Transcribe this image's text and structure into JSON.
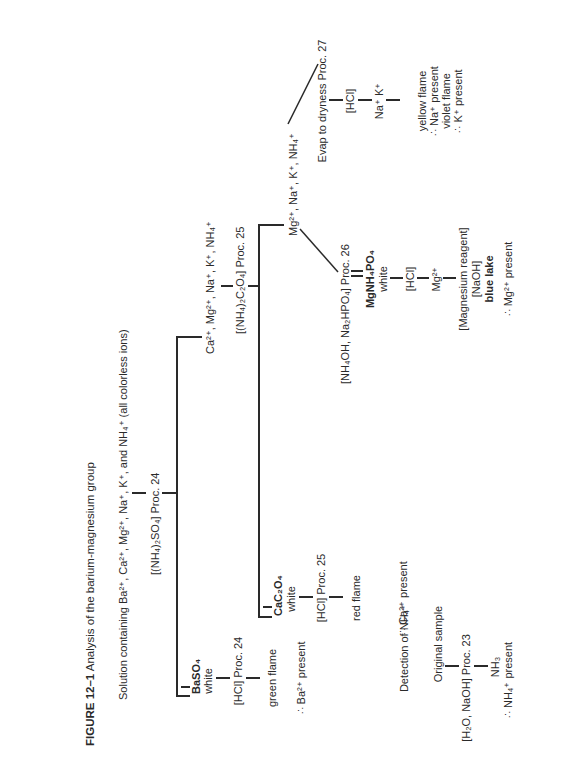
{
  "figure": {
    "title_label": "FIGURE 12–1",
    "title_text": "Analysis of the barium-magnesium group"
  },
  "solution": {
    "prefix": "Solution containing Ba",
    "ions_text": "Solution containing Ba²⁺, Ca²⁺, Mg²⁺, Na⁺, K⁺, and NH₄⁺ (all colorless ions)"
  },
  "steps": {
    "reagent_1": "[(NH₄)₂SO₄] Proc. 24",
    "baso4": "BaSO₄",
    "baso4_color": "white",
    "ba_reagent": "[HCl] Proc. 24",
    "ba_flame": "green flame",
    "ba_result": "∴ Ba²⁺ present",
    "filtrate_1": "Ca²⁺, Mg²⁺, Na⁺, K⁺, NH₄⁺",
    "reagent_2": "[(NH₄)₂C₂O₄] Proc. 25",
    "cac2o4": "CaC₂O₄",
    "cac2o4_color": "white",
    "ca_reagent": "[HCl] Proc. 25",
    "ca_flame": "red flame",
    "ca_result": "∴ Ca²⁺ present",
    "filtrate_2": "Mg²⁺, Na⁺, K⁺, NH₄⁺",
    "reagent_3": "[NH₄OH, Na₂HPO₄] Proc. 26",
    "mgnh4po4": "MgNH₄PO₄",
    "mgnh4po4_color": "white",
    "mg_hcl": "[HCl]",
    "mg_ion": "Mg²⁺",
    "mg_reagent": "[Magnesium reagent]",
    "mg_naoh": "[NaOH]",
    "mg_lake": "blue lake",
    "mg_result": "∴ Mg²⁺ present",
    "evap": "Evap to dryness Proc. 27",
    "nak_hcl": "[HCl]",
    "nak_ions": "Na⁺ K⁺",
    "na_flame": "yellow flame",
    "na_result": "∴ Na⁺ present",
    "k_flame": "violet flame",
    "k_result": "∴ K⁺ present"
  },
  "nh4_detection": {
    "heading": "Detection of NH₄⁺",
    "sample": "Original sample",
    "reagent": "[H₂O, NaOH] Proc. 23",
    "product": "NH₃",
    "result": "∴ NH₄⁺ present"
  }
}
